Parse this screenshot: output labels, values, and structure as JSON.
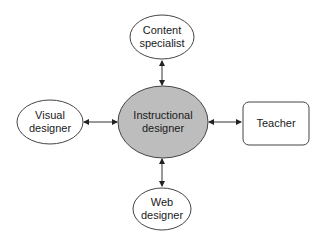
{
  "diagram": {
    "center": {
      "id": "instructional-designer",
      "line1": "Instructional",
      "line2": "designer",
      "shape": "ellipse",
      "fill": "#bdbdbd"
    },
    "nodes": [
      {
        "id": "content-specialist",
        "line1": "Content",
        "line2": "specialist",
        "shape": "ellipse",
        "position": "top"
      },
      {
        "id": "visual-designer",
        "line1": "Visual",
        "line2": "designer",
        "shape": "ellipse",
        "position": "left"
      },
      {
        "id": "teacher",
        "line1": "Teacher",
        "shape": "rounded-rectangle",
        "position": "right"
      },
      {
        "id": "web-designer",
        "line1": "Web",
        "line2": "designer",
        "shape": "ellipse",
        "position": "bottom"
      }
    ],
    "edges": [
      {
        "from": "instructional-designer",
        "to": "content-specialist",
        "type": "bidirectional-arrow"
      },
      {
        "from": "instructional-designer",
        "to": "visual-designer",
        "type": "bidirectional-arrow"
      },
      {
        "from": "instructional-designer",
        "to": "teacher",
        "type": "bidirectional-arrow"
      },
      {
        "from": "instructional-designer",
        "to": "web-designer",
        "type": "bidirectional-arrow"
      }
    ],
    "colors": {
      "stroke": "#333333",
      "center_fill": "#bdbdbd",
      "node_fill": "#ffffff"
    }
  }
}
